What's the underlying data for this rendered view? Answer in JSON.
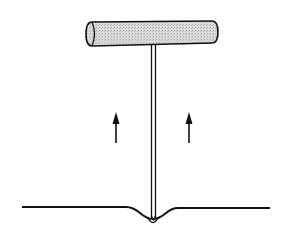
{
  "diagram": {
    "description": "T-handle tool being pulled upward out of a surface",
    "elements": {
      "handle": {
        "label": "T-handle",
        "fill": "#d0d0d0"
      },
      "shaft": {
        "label": "shaft"
      },
      "arrows": [
        {
          "label": "pull-up arrow left",
          "direction": "up"
        },
        {
          "label": "pull-up arrow right",
          "direction": "up"
        }
      ],
      "surface": {
        "label": "surface line with depression"
      }
    },
    "colors": {
      "stroke": "#111111",
      "background": "#ffffff",
      "handle_fill": "#d0d0d0"
    }
  }
}
